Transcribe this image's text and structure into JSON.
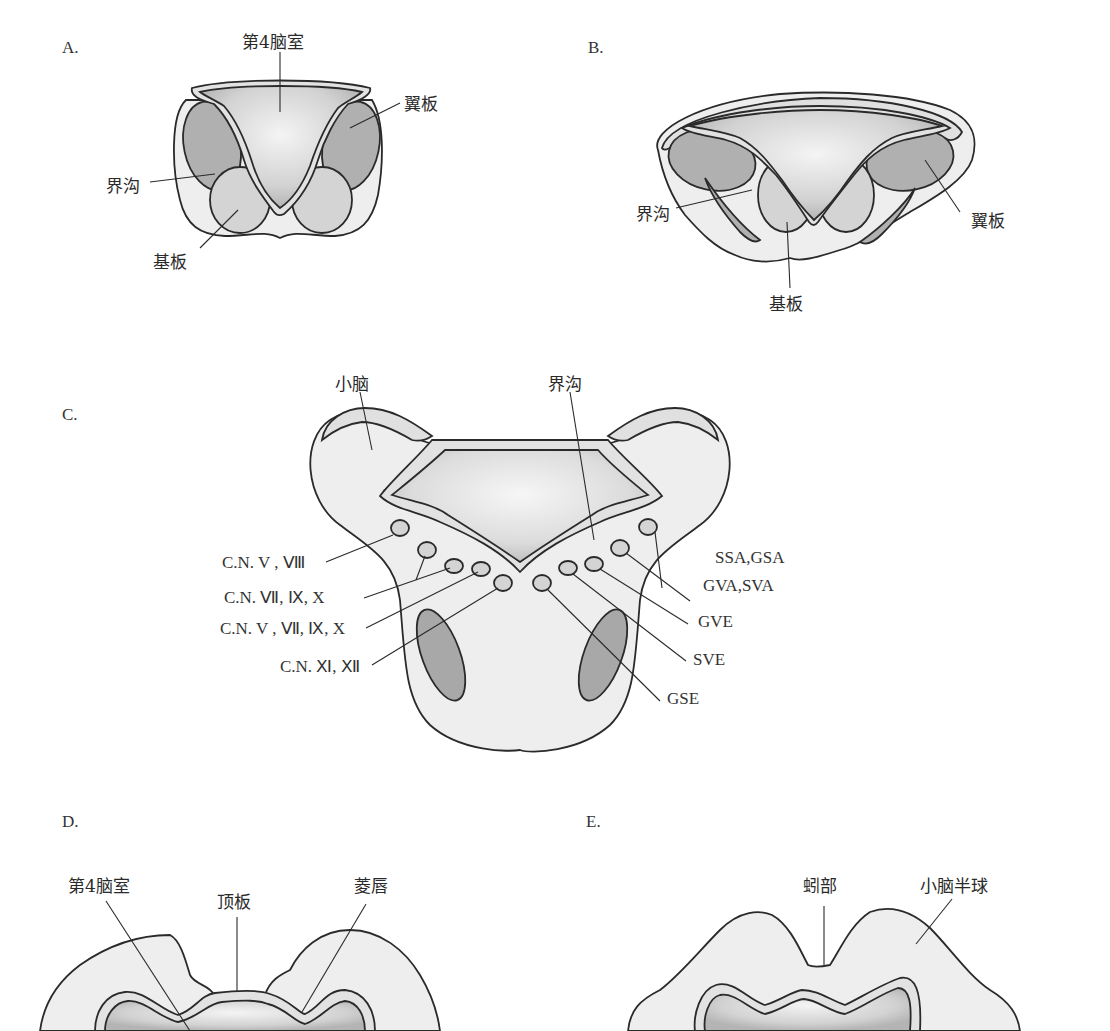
{
  "panels": {
    "A": {
      "letter": "A.",
      "labels": {
        "fourth_ventricle": "第4脑室",
        "alar_plate": "翼板",
        "sulcus_limitans": "界沟",
        "basal_plate": "基板"
      }
    },
    "B": {
      "letter": "B.",
      "labels": {
        "sulcus_limitans": "界沟",
        "alar_plate": "翼板",
        "basal_plate": "基板"
      }
    },
    "C": {
      "letter": "C.",
      "labels": {
        "cerebellum": "小脑",
        "sulcus_limitans": "界沟",
        "cn_v_viii": "C.N.  V , Ⅷ",
        "cn_vii_ix_x": "C.N.  Ⅶ, Ⅸ, X",
        "cn_v_vii_ix_x": "C.N.  V , Ⅶ, Ⅸ, X",
        "cn_xi_xii": "C.N.  Ⅺ, Ⅻ",
        "ssa_gsa": "SSA,GSA",
        "gva_sva": "GVA,SVA",
        "gve": "GVE",
        "sve": "SVE",
        "gse": "GSE"
      }
    },
    "D": {
      "letter": "D.",
      "labels": {
        "fourth_ventricle": "第4脑室",
        "roof_plate": "顶板",
        "rhombic_lip": "菱唇"
      }
    },
    "E": {
      "letter": "E.",
      "labels": {
        "vermis": "蚓部",
        "cerebellar_hemisphere": "小脑半球"
      }
    }
  },
  "colors": {
    "outline": "#2a2a2a",
    "outer_tissue": "#eeeeee",
    "light_layer": "#dedede",
    "plate_mid": "#c8c8c8",
    "plate_dark": "#a8a8a8",
    "ventricle_center": "#f2f2f2",
    "ventricle_edge": "#b0b0b0"
  }
}
